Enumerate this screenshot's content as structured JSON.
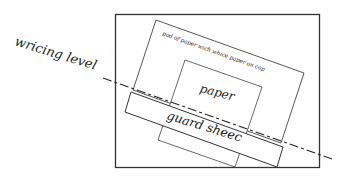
{
  "diagram": {
    "labels": {
      "writing_level": "wricing level",
      "pad": "pad of paper wich whice paper on cop",
      "paper": "paper",
      "guard_sheet": "guard sheec"
    },
    "intended_text": {
      "writing_level": "writing level",
      "pad": "pad of paper with white paper on top",
      "paper": "paper",
      "guard_sheet": "guard sheet"
    },
    "colors": {
      "line": "#333333",
      "text": "#1a1a1a",
      "background": "#ffffff"
    }
  }
}
